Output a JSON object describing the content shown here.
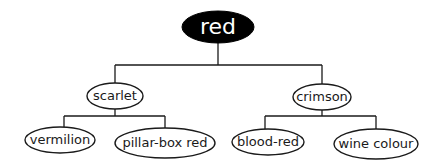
{
  "diagram": {
    "type": "tree",
    "root": {
      "label": "red",
      "fill": "#000000",
      "text_color": "#ffffff"
    },
    "level1": [
      {
        "label": "scarlet"
      },
      {
        "label": "crimson"
      }
    ],
    "level2": [
      {
        "label": "vermilion",
        "parent": "scarlet"
      },
      {
        "label": "pillar-box red",
        "parent": "scarlet"
      },
      {
        "label": "blood-red",
        "parent": "crimson"
      },
      {
        "label": "wine colour",
        "parent": "crimson"
      }
    ]
  }
}
